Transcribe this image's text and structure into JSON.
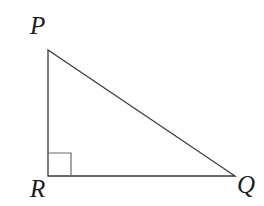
{
  "figure": {
    "name": "right-triangle-PQR",
    "canvas": {
      "width": 264,
      "height": 206,
      "background": "#ffffff"
    },
    "stroke_color": "#3a3a3a",
    "stroke_width": 1.3,
    "vertices": [
      {
        "id": "P",
        "label": "P",
        "x": 48,
        "y": 50
      },
      {
        "id": "Q",
        "label": "Q",
        "x": 235,
        "y": 176
      },
      {
        "id": "R",
        "label": "R",
        "x": 48,
        "y": 176
      }
    ],
    "edges": [
      {
        "id": "PR",
        "from": "P",
        "to": "R",
        "role": "vertical-leg"
      },
      {
        "id": "RQ",
        "from": "R",
        "to": "Q",
        "role": "horizontal-leg"
      },
      {
        "id": "PQ",
        "from": "P",
        "to": "Q",
        "role": "hypotenuse"
      }
    ],
    "right_angle_marker": {
      "at_vertex": "R",
      "size": 23,
      "x": 48,
      "y": 153
    },
    "labels": {
      "P": "P",
      "Q": "Q",
      "R": "R"
    }
  }
}
